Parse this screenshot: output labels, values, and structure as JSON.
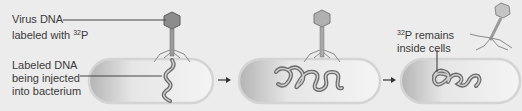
{
  "diagram": {
    "labels": {
      "virus_dna_line1": "Virus DNA",
      "virus_dna_line2_prefix": "labeled with ",
      "isotope_mass": "32",
      "isotope_symbol": "P",
      "injected_line1": "Labeled DNA",
      "injected_line2": "being injected",
      "injected_line3": "into bacterium",
      "remains_suffix": "P remains",
      "remains_line2": "inside cells"
    },
    "stages": [
      {
        "id": "injection",
        "description": "Phage attached to bacterium injecting labeled DNA"
      },
      {
        "id": "replication",
        "description": "Labeled DNA inside bacterium, phage attached"
      },
      {
        "id": "result",
        "description": "32P remains inside cell; phage detached"
      }
    ],
    "colors": {
      "background": "#ececec",
      "cell_fill_dark": "#b8b8b8",
      "cell_fill_light": "#f2f2f2",
      "cell_outline": "#d0d0d0",
      "dna": "#6a6a6a",
      "text": "#3a3a3a"
    }
  }
}
